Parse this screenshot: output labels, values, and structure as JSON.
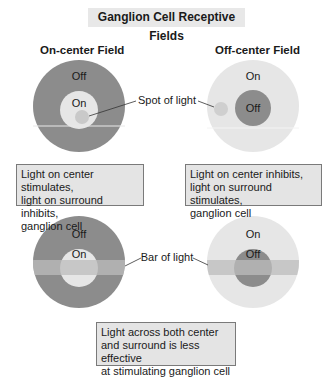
{
  "title": "Ganglion Cell Receptive Fields",
  "fields": [
    {
      "heading": "On-center Field",
      "surround_label": "Off",
      "center_label": "On"
    },
    {
      "heading": "Off-center Field",
      "surround_label": "On",
      "center_label": "Off"
    }
  ],
  "bottom_fields": [
    {
      "surround_label": "Off",
      "center_label": "On"
    },
    {
      "surround_label": "On",
      "center_label": "Off"
    }
  ],
  "callouts": {
    "spot": "Spot of light",
    "bar": "Bar of light"
  },
  "notes": {
    "on_center": [
      "Light on center stimulates,",
      "light on surround inhibits,",
      "ganglion cell"
    ],
    "off_center": [
      "Light on center inhibits,",
      "light on surround stimulates,",
      "ganglion cell"
    ],
    "both": [
      "Light across both center",
      "and surround is less effective",
      "at stimulating ganglion cell"
    ]
  },
  "colors": {
    "dark_field": "#8c8c8c",
    "light_field": "#e6e6e6",
    "spot": "#c9c9c9",
    "bar": "#bcbcbc",
    "note_bg": "#e4e4e4"
  }
}
